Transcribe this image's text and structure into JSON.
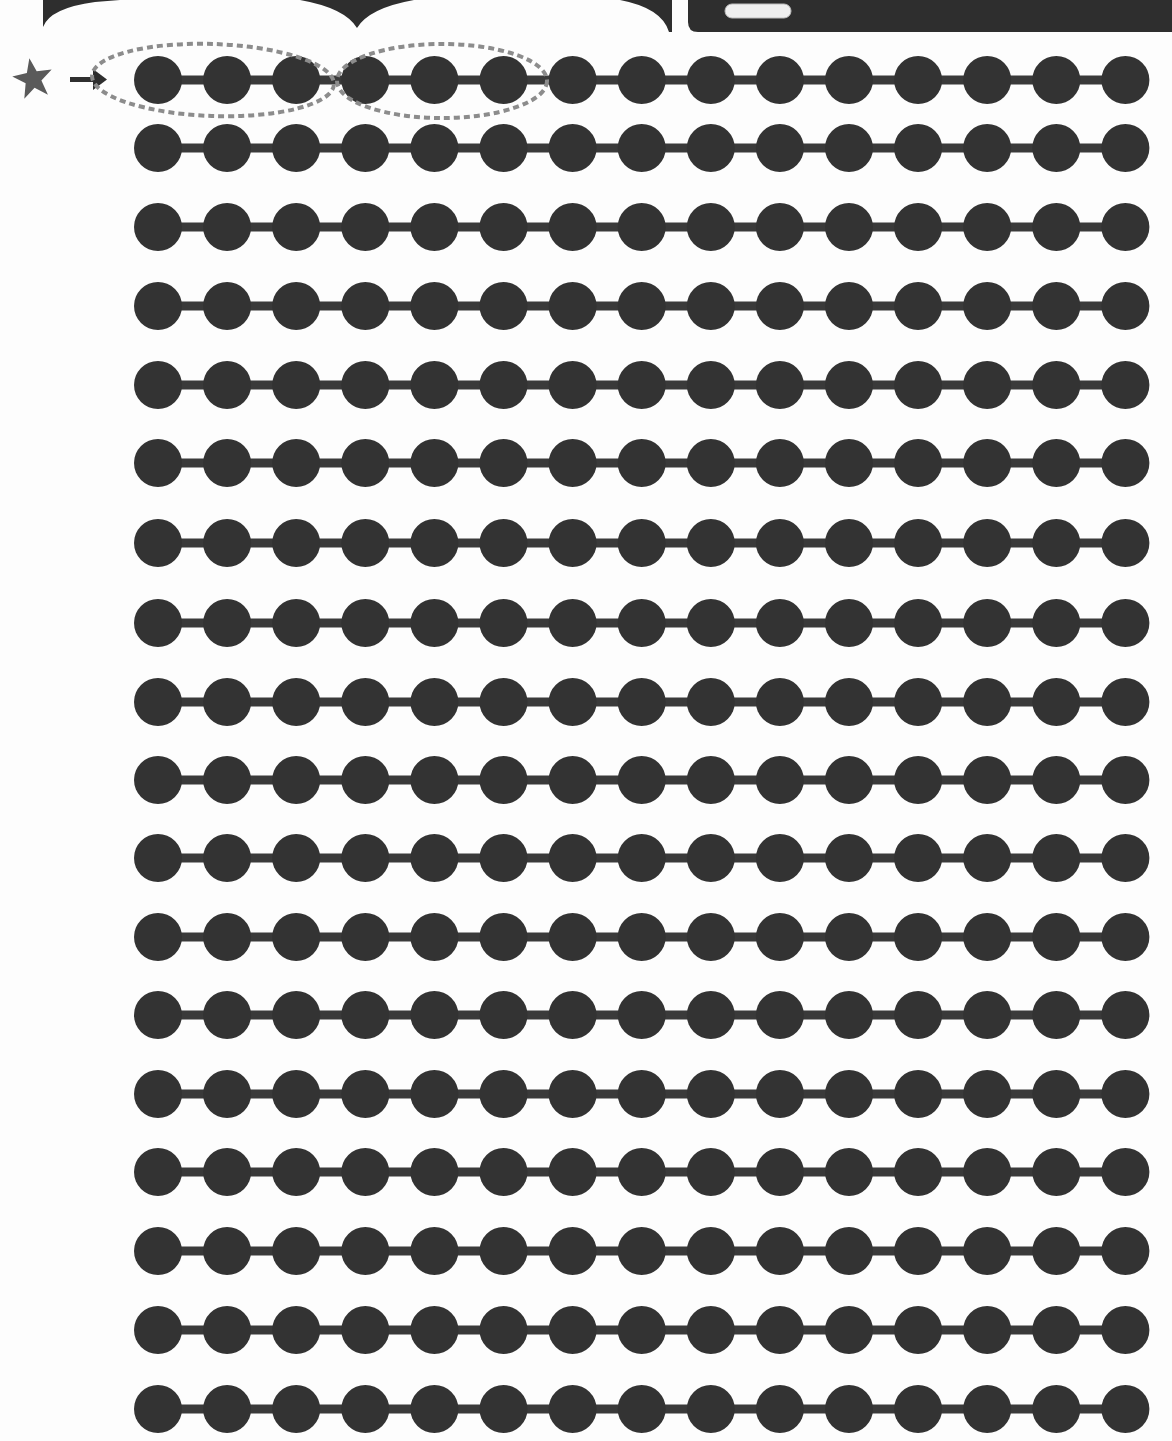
{
  "worksheet": {
    "type": "bead-string counting exercise",
    "row_count": 18,
    "beads_per_row": 15,
    "total_beads": 270,
    "start_marker": {
      "icon": "star-icon",
      "color": "#5a5a5a",
      "pointer": "arrow-right-icon"
    },
    "grouping_hint": {
      "description": "first row: two dashed ovals each circling 3 beads",
      "groups": [
        {
          "row": 1,
          "bead_from": 1,
          "bead_to": 3
        },
        {
          "row": 1,
          "bead_from": 4,
          "bead_to": 6
        }
      ],
      "stroke_color": "#8c8c8c"
    },
    "colors": {
      "bead": "#333333",
      "string": "#3a3a3a",
      "background": "#fdfdfd",
      "header_dark": "#2e2e2e",
      "pill": "#efefef"
    },
    "header": {
      "scallops": 2,
      "panel_pill": ""
    }
  },
  "layout": {
    "first_bead_x": 158,
    "bead_pitch_x": 69.1,
    "bead_radius": 24,
    "bar_thickness": 9,
    "row_centers_y": [
      80,
      148,
      227,
      306,
      385,
      463,
      543,
      623,
      702,
      780,
      858,
      937,
      1015,
      1094,
      1172,
      1251,
      1330,
      1409
    ]
  }
}
